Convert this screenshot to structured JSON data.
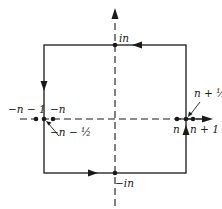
{
  "diagram": {
    "type": "contour-integration-square",
    "colors": {
      "stroke": "#1a1a1a",
      "background": "#ffffff"
    },
    "axes": {
      "real_axis": {
        "style": "dashed",
        "arrow": "right"
      },
      "imaginary_axis": {
        "style": "dashed",
        "arrow": "up"
      }
    },
    "contour": {
      "shape": "square",
      "direction": "counterclockwise",
      "edge_arrows": [
        "top-left",
        "left-down",
        "bottom-right",
        "right-up"
      ]
    },
    "points": [
      {
        "id": "in",
        "label": "in"
      },
      {
        "id": "neg-in",
        "label": "−in"
      },
      {
        "id": "neg-n-minus-1",
        "label": "−n − 1"
      },
      {
        "id": "neg-n",
        "label": "−n"
      },
      {
        "id": "neg-n-minus-half",
        "label": "−n − ½"
      },
      {
        "id": "n",
        "label": "n"
      },
      {
        "id": "n-plus-1",
        "label": "n + 1"
      },
      {
        "id": "n-plus-half",
        "label": "n + ½"
      }
    ]
  }
}
